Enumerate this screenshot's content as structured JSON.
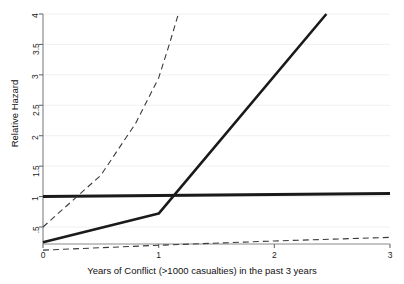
{
  "chart_data": {
    "type": "line",
    "title": "",
    "xlabel": "Years of Conflict (>1000 casualties) in the past 3 years",
    "ylabel": "Relative Hazard",
    "xlim": [
      0,
      3
    ],
    "ylim": [
      0,
      4
    ],
    "grid": true,
    "grid_axis": "y",
    "legend": "none",
    "xticks": [
      0,
      1,
      2,
      3
    ],
    "xtick_labels": [
      "0",
      "1",
      "2",
      "3"
    ],
    "yticks": [
      0.5,
      1,
      1.5,
      2,
      2.5,
      3,
      3.5,
      4
    ],
    "ytick_labels": [
      ".5",
      "1",
      "1.5",
      "2",
      "2.5",
      "3",
      "3.5",
      "4"
    ],
    "series": [
      {
        "name": "reference-line",
        "style": "solid",
        "width": 3.0,
        "color": "#1a1a1a",
        "x": [
          0,
          3
        ],
        "values": [
          1.0,
          1.05
        ]
      },
      {
        "name": "hazard-estimate",
        "style": "solid",
        "width": 2.6,
        "color": "#1a1a1a",
        "x": [
          0,
          1,
          2.45
        ],
        "values": [
          0.25,
          0.72,
          4.0
        ]
      },
      {
        "name": "upper-confidence-bound",
        "style": "dashed",
        "width": 1.1,
        "color": "#3a3a3a",
        "x": [
          0,
          0.5,
          0.8,
          1.0,
          1.1,
          1.17
        ],
        "values": [
          0.5,
          1.35,
          2.2,
          2.95,
          3.55,
          4.0
        ]
      },
      {
        "name": "lower-confidence-bound",
        "style": "dashed",
        "width": 1.1,
        "color": "#3a3a3a",
        "x": [
          0,
          1,
          2,
          3
        ],
        "values": [
          0.12,
          0.2,
          0.27,
          0.33
        ]
      }
    ]
  },
  "axes": {
    "y_title": "Relative Hazard",
    "x_title": "Years of Conflict (>1000 casualties) in the past 3 years"
  }
}
